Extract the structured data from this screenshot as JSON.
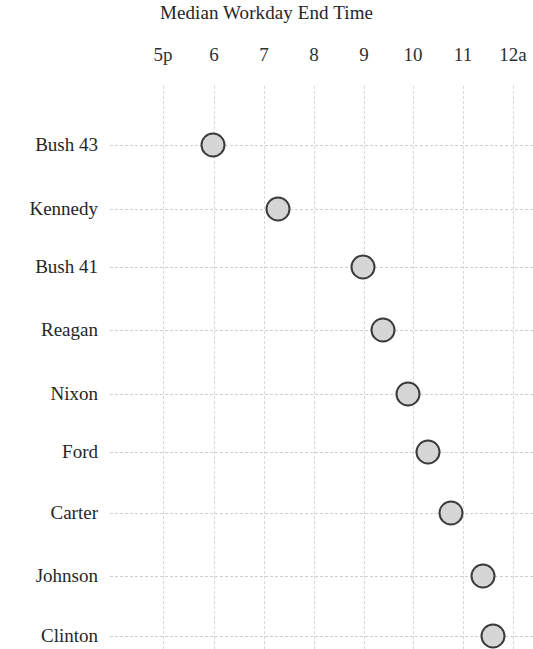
{
  "chart_data": {
    "type": "scatter",
    "title": "Median Workday End Time",
    "xlabel": "",
    "ylabel": "",
    "grid": true,
    "legend": false,
    "orientation": "horizontal-dot-plot",
    "xlim": [
      17,
      24
    ],
    "x_tick_values": [
      17,
      18,
      19,
      20,
      21,
      22,
      23,
      24
    ],
    "x_tick_labels": [
      "5p",
      "6",
      "7",
      "8",
      "9",
      "10",
      "11",
      "12a"
    ],
    "categories": [
      "Bush 43",
      "Kennedy",
      "Bush 41",
      "Reagan",
      "Nixon",
      "Ford",
      "Carter",
      "Johnson",
      "Clinton"
    ],
    "values": [
      18.0,
      19.3,
      21.0,
      21.4,
      21.9,
      22.3,
      22.75,
      23.4,
      23.6
    ],
    "value_labels": [
      "6:00p",
      "7:18p",
      "9:00p",
      "9:24p",
      "9:54p",
      "10:18p",
      "10:45p",
      "11:24p",
      "11:36p"
    ],
    "series": [
      {
        "name": "Median Workday End Time",
        "values": [
          18.0,
          19.3,
          21.0,
          21.4,
          21.9,
          22.3,
          22.75,
          23.4,
          23.6
        ]
      }
    ],
    "marker": {
      "shape": "circle",
      "fill_color": "#d6d6d6",
      "edge_color": "#3b3b3b"
    },
    "gridline_color": "#d4d4d4"
  },
  "layout": {
    "plot_left_px": 110,
    "plot_top_px": 86,
    "x_pixel_positions": [
      163,
      214,
      264,
      314,
      364,
      413,
      463,
      513
    ],
    "row_pixel_positions": [
      145,
      209,
      267,
      330,
      394,
      452,
      513,
      576,
      636
    ]
  }
}
